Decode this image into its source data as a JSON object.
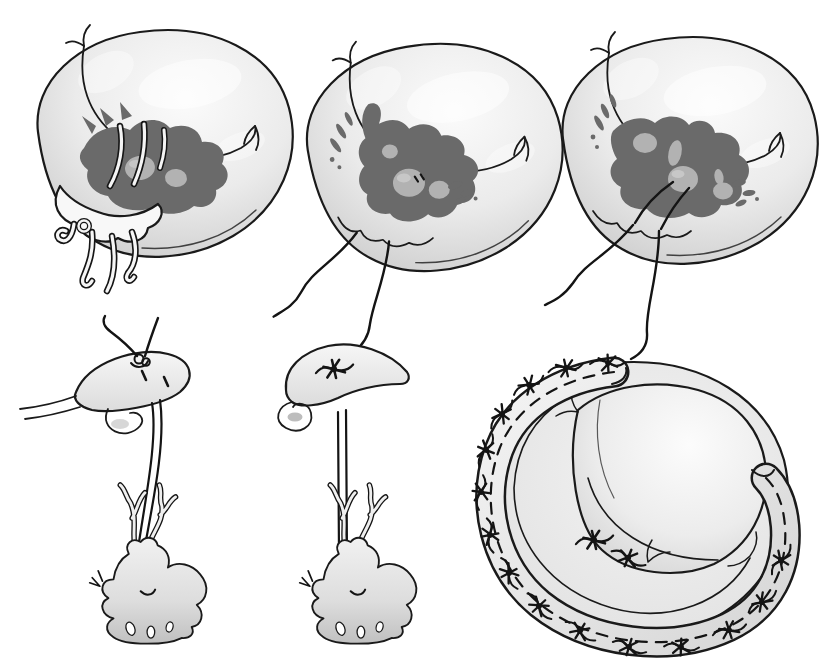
{
  "figure": {
    "type": "medical-illustration",
    "visible_text": "",
    "background": "#ffffff",
    "colors": {
      "outline": "#1a1a1a",
      "thread": "#141414",
      "orifice": "#6a6a6a",
      "muscle-head": "#b2b2b2",
      "tissue": "#e6e6e6",
      "tissue-light": "#f6f6f6",
      "tissue-shadow": "#bdbdbd",
      "paper": "#ffffff"
    },
    "layout": {
      "rows": 2,
      "top_row_panels": 3,
      "bottom_row_panels": 3
    },
    "panels": [
      {
        "name": "valve-with-flail-segment-ruptured-chordae",
        "position": "top-left"
      },
      {
        "name": "valve-after-resection-two-sutures-hanging",
        "position": "top-middle"
      },
      {
        "name": "valve-sutures-anchored-to-papillary-head",
        "position": "top-right"
      },
      {
        "name": "neochord-knot-being-tied-on-leaflet",
        "position": "bottom-left"
      },
      {
        "name": "neochord-tied-taut-to-papillary-muscle",
        "position": "bottom-middle"
      },
      {
        "name": "valve-with-open-annuloplasty-band",
        "position": "bottom-right"
      }
    ],
    "annuloplasty_band": {
      "band_suture_knots": 15,
      "leaflet_suture_knots": 2,
      "dashed_suture_line": true
    }
  }
}
